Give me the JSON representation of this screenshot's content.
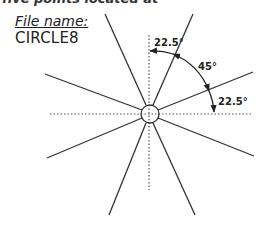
{
  "header": {
    "top_fragment": "five points located at"
  },
  "file": {
    "label": "File name:",
    "value": "CIRCLE8"
  },
  "diagram": {
    "center": [
      150,
      114
    ],
    "circle_radius": 9,
    "angle_labels": {
      "top": "22.5°",
      "middle": "45°",
      "right": "22.5°"
    },
    "line_color": "#333333"
  }
}
